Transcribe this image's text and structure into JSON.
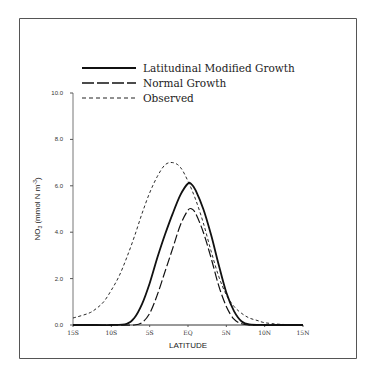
{
  "chart_data": {
    "type": "line",
    "title": "",
    "xlabel": "LATITUDE",
    "ylabel": "NO3 (mmol N m-3)",
    "xlim": [
      -15,
      15
    ],
    "ylim": [
      0,
      10
    ],
    "grid": false,
    "legend_position": "top",
    "x_tick_labels": [
      "15S",
      "10S",
      "5S",
      "EQ",
      "5N",
      "10N",
      "15N"
    ],
    "x_tick_values": [
      -15,
      -10,
      -5,
      0,
      5,
      10,
      15
    ],
    "y_tick_labels": [
      "0.0",
      "2.0",
      "4.0",
      "6.0",
      "8.0",
      "10.0"
    ],
    "y_tick_values": [
      0,
      2,
      4,
      6,
      8,
      10
    ],
    "series": [
      {
        "name": "Latitudinal Modified Growth",
        "style": "solid",
        "x": [
          -15,
          -12,
          -10,
          -8,
          -7,
          -6,
          -5,
          -4,
          -3,
          -2,
          -1,
          0,
          0.5,
          1,
          2,
          3,
          4,
          5,
          6,
          7,
          8,
          10,
          12,
          15
        ],
        "y": [
          0,
          0,
          0,
          0.05,
          0.3,
          0.9,
          1.8,
          2.9,
          3.9,
          4.8,
          5.6,
          6.1,
          6.05,
          5.8,
          5.0,
          3.9,
          2.6,
          1.4,
          0.6,
          0.15,
          0.02,
          0,
          0,
          0
        ]
      },
      {
        "name": "Normal Growth",
        "style": "dashed",
        "x": [
          -15,
          -10,
          -7,
          -6,
          -5,
          -4,
          -3,
          -2,
          -1,
          0,
          0.5,
          1,
          2,
          3,
          4,
          5,
          6,
          7,
          8,
          10,
          15
        ],
        "y": [
          0,
          0,
          0,
          0.1,
          0.5,
          1.3,
          2.3,
          3.3,
          4.3,
          4.95,
          5.0,
          4.8,
          4.0,
          2.9,
          1.7,
          0.8,
          0.25,
          0.05,
          0,
          0,
          0
        ]
      },
      {
        "name": "Observed",
        "style": "dotted-dash",
        "x": [
          -15,
          -13,
          -12,
          -11,
          -10,
          -9,
          -8,
          -7,
          -6,
          -5,
          -4,
          -3,
          -2,
          -1,
          0,
          1,
          2,
          3,
          4,
          5,
          6,
          7,
          8,
          9,
          10,
          12,
          15
        ],
        "y": [
          0.3,
          0.5,
          0.7,
          1.0,
          1.5,
          2.1,
          2.9,
          3.8,
          4.8,
          5.7,
          6.4,
          6.9,
          7.0,
          6.8,
          6.2,
          5.4,
          4.4,
          3.2,
          2.1,
          1.3,
          0.8,
          0.5,
          0.3,
          0.2,
          0.1,
          0.03,
          0
        ]
      }
    ]
  },
  "legend": {
    "items": [
      {
        "label": "Latitudinal Modified Growth",
        "style": "solid"
      },
      {
        "label": "Normal Growth",
        "style": "dashed"
      },
      {
        "label": "Observed",
        "style": "dotted-dash"
      }
    ]
  },
  "axes": {
    "xlabel": "LATITUDE",
    "ylabel_main": "NO",
    "ylabel_sub": "3",
    "ylabel_units": " (mmol N m",
    "ylabel_sup": "-3",
    "ylabel_close": ")"
  }
}
